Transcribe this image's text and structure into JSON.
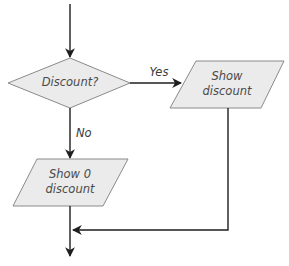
{
  "diagram": {
    "type": "flowchart",
    "colors": {
      "shape_fill": "#ebebeb",
      "shape_stroke": "#8a8a8a",
      "edge": "#1e1e1e",
      "text": "#4a4a4a"
    },
    "nodes": [
      {
        "id": "decision",
        "shape": "diamond",
        "text": "Discount?"
      },
      {
        "id": "show_discount",
        "shape": "parallelogram",
        "line1": "Show",
        "line2": "discount"
      },
      {
        "id": "show_zero",
        "shape": "parallelogram",
        "line1": "Show 0",
        "line2": "discount"
      }
    ],
    "edges": [
      {
        "from": "start",
        "to": "decision",
        "label": ""
      },
      {
        "from": "decision",
        "to": "show_discount",
        "label": "Yes"
      },
      {
        "from": "decision",
        "to": "show_zero",
        "label": "No"
      },
      {
        "from": "show_discount",
        "to": "merge",
        "label": ""
      },
      {
        "from": "show_zero",
        "to": "end",
        "label": ""
      }
    ]
  }
}
